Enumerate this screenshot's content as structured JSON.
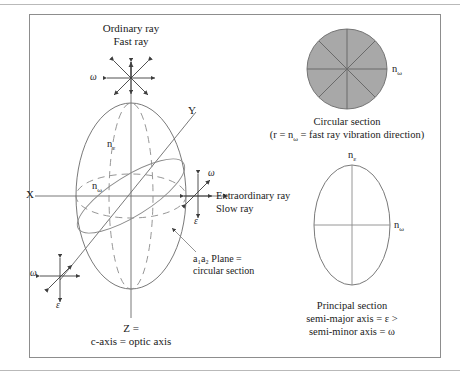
{
  "figure": {
    "border_color": "#8d8d8d",
    "line_color": "#555555",
    "dash_color": "#8a8a8a",
    "fill_gray": "#a8a8a8",
    "background": "#ffffff"
  },
  "main_diagram": {
    "top_label_line1": "Ordinary ray",
    "top_label_line2": "Fast ray",
    "right_label_line1": "Extraordinary ray",
    "right_label_line2": "Slow ray",
    "bottom_label_line1": "Z =",
    "bottom_label_line2": "c-axis = optic axis",
    "axis_x": "X",
    "axis_y": "Y",
    "index_epsilon": "n",
    "index_epsilon_sub": "ε",
    "index_omega": "n",
    "index_omega_sub": "ω",
    "annotation_line1": "a₁a₂ Plane =",
    "annotation_line2": "circular section",
    "vibration_omega": "ω",
    "vibration_epsilon": "ε"
  },
  "circular_section": {
    "index_label": "n",
    "index_sub": "ω",
    "caption_line1": "Circular section",
    "caption_line2": "(r = n",
    "caption_line2_sub": "ω",
    "caption_line2_rest": " = fast ray vibration direction)",
    "spokes": 8,
    "fill": "#a8a8a8"
  },
  "principal_section": {
    "top_label": "n",
    "top_label_sub": "ε",
    "right_label": "n",
    "right_label_sub": "ω",
    "caption_line1": "Principal section",
    "caption_line2": "semi-major axis = ε >",
    "caption_line3": "semi-minor axis = ω"
  }
}
